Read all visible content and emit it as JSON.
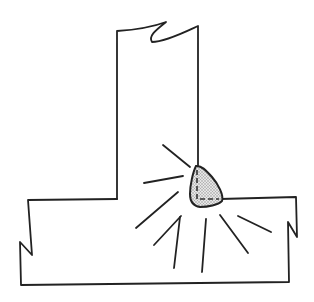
{
  "diagram": {
    "type": "technical-illustration",
    "colors": {
      "ink": "#222222",
      "background": "#ffffff",
      "weld_fill": "#c8c8c8"
    },
    "elements": {
      "vertical_member": {
        "label": "vertical-plate",
        "broken_top": true
      },
      "base_plate": {
        "label": "base-plate",
        "broken_ends": true
      },
      "weld_bead": {
        "label": "fillet-weld",
        "shaded": true,
        "dashed_root_lines": true
      },
      "rays": {
        "count": 8
      }
    }
  }
}
